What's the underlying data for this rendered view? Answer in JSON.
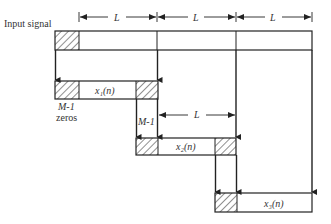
{
  "diagram": {
    "title_label": "Input signal",
    "segment_length_label": "L",
    "overlap_label": "M-1",
    "zeros_label": "zeros",
    "blocks": [
      {
        "name": "x1",
        "label": "x₁(n)"
      },
      {
        "name": "x2",
        "label": "x₂(n)"
      },
      {
        "name": "x3",
        "label": "x₃(n)"
      }
    ],
    "dimension_labels": [
      "L",
      "L",
      "L",
      "L"
    ],
    "colors": {
      "line": "#2a2a2a",
      "hatch": "#333333",
      "background": "#ffffff"
    }
  }
}
